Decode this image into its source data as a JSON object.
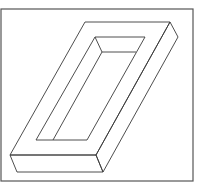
{
  "figure": {
    "stroke_color": "#3a3a3a",
    "border_color": "#555555",
    "background": "#ffffff",
    "border": {
      "x": 1,
      "y": 9,
      "width": 192,
      "height": 172
    },
    "outer_top_face": [
      [
        85,
        22
      ],
      [
        170,
        22
      ],
      [
        96,
        155
      ],
      [
        10,
        155
      ]
    ],
    "right_side_face": [
      [
        170,
        22
      ],
      [
        178,
        37
      ],
      [
        103,
        172
      ],
      [
        96,
        155
      ]
    ],
    "front_face": [
      [
        10,
        155
      ],
      [
        96,
        155
      ],
      [
        103,
        172
      ],
      [
        17,
        172
      ]
    ],
    "inner_opening": [
      [
        95,
        37
      ],
      [
        145,
        37
      ],
      [
        87,
        140
      ],
      [
        36,
        140
      ]
    ],
    "inner_wall_top_edge": [
      [
        95,
        37
      ],
      [
        102,
        52
      ],
      [
        136,
        52
      ]
    ],
    "inner_wall_left_edge": [
      [
        102,
        52
      ],
      [
        53,
        140
      ]
    ]
  }
}
